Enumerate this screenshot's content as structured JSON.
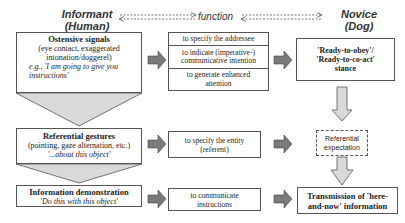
{
  "headers": {
    "informant": "Informant (Human)",
    "informant_line1": "Informant",
    "informant_line2": "(Human)",
    "function": "function",
    "novice_line1": "Novice",
    "novice_line2": "(Dog)"
  },
  "left": {
    "ostensive": {
      "title": "Ostensive signals",
      "line1": "(eye contact, exaggerated",
      "line2": "intonation/doggerel)",
      "example1": "e.g., 'I am going to give you",
      "example2": "instructions'"
    },
    "referential": {
      "title": "Referential gestures",
      "line1": "(pointing, gaze alternation, etc.)",
      "example": "'...about this object'"
    },
    "demonstration": {
      "title": "Information demonstration",
      "example": "'Do this with this object'"
    }
  },
  "middle": {
    "functions1": [
      {
        "line1": "to specify the addressee",
        "line2": ""
      },
      {
        "line1": "to indicate (imperative-)",
        "line2": "communicative intention"
      },
      {
        "line1": "to generate enhanced",
        "line2": "attention"
      }
    ],
    "functions2": {
      "line1": "to specify the entity",
      "line2": "(referent)"
    },
    "functions3": {
      "line1": "to communicate",
      "line2": "instructions"
    }
  },
  "right": {
    "stance": {
      "line1": "'Ready-to-obey'/",
      "line2": "'Ready-to-co-act'",
      "line3": "stance"
    },
    "expectation": {
      "line1": "Referential",
      "line2": "expectation"
    },
    "transmission": {
      "line1": "Transmission of 'here-",
      "line2": "and-now' information"
    }
  },
  "colors": {
    "block_arrow": "#7a7a7a",
    "down_arrow_fill": "#d9d9d9",
    "funnel_fill": "#d9d9d9",
    "border": "#555555"
  }
}
